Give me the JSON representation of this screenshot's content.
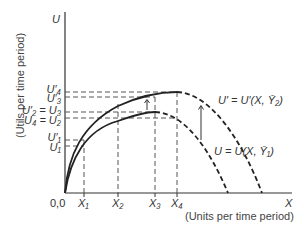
{
  "diagram": {
    "y_axis": {
      "symbol": "U",
      "title": "(Utils per time period)"
    },
    "x_axis": {
      "symbol": "X",
      "title": "(Units per time period)",
      "origin": "0,0"
    },
    "y_labels": [
      {
        "text": "U′₄",
        "y": 92
      },
      {
        "text": "U′₃",
        "y": 98
      },
      {
        "text": "U′₂ = U₃",
        "y": 112
      },
      {
        "text": "U₄ = U₂",
        "y": 118
      },
      {
        "text": "U′₁",
        "y": 140
      },
      {
        "text": "U₁",
        "y": 146
      }
    ],
    "x_labels": [
      {
        "text": "X₁",
        "x": 84
      },
      {
        "text": "X₂",
        "x": 118
      },
      {
        "text": "X₃",
        "x": 155
      },
      {
        "text": "X₄",
        "x": 177
      }
    ],
    "curves": [
      {
        "name": "U = U(X, Ȳ₁)",
        "label": "U = U(X, Ȳ₁)"
      },
      {
        "name": "U′ = U′(X, Ȳ₂)",
        "label": "U′ = U′(X, Ȳ₂)"
      }
    ],
    "colors": {
      "line": "#222222",
      "dash": "#555555"
    }
  }
}
